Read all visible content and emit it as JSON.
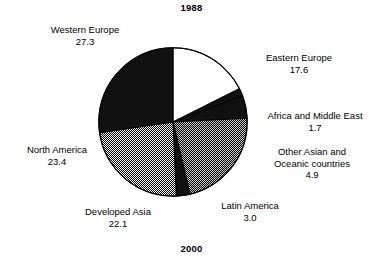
{
  "titles": {
    "top": "1988",
    "bottom": "2000"
  },
  "chart_data": {
    "type": "pie",
    "title": "1988",
    "subtitle": "2000",
    "xlabel": "",
    "ylabel": "",
    "units": "percent share",
    "total": 100.0,
    "legend_position": "callout-labels",
    "grid": false,
    "start_angle_deg": 0,
    "direction": "clockwise",
    "categories": [
      "Eastern Europe",
      "Africa and Middle East",
      "Other Asian and Oceanic countries",
      "Developed Asia",
      "Latin America",
      "North America",
      "Western Europe"
    ],
    "values": [
      17.6,
      1.7,
      4.9,
      22.1,
      3.0,
      23.4,
      27.3
    ],
    "slices": [
      {
        "label": "Eastern Europe",
        "label_line1": "Eastern Europe",
        "value": "17.6",
        "value_num": 17.6,
        "fill": "white",
        "fill_color": "#ffffff"
      },
      {
        "label": "Africa and Middle East",
        "label_line1": "Africa and Middle East",
        "value": "1.7",
        "value_num": 1.7,
        "fill": "black",
        "fill_color": "#111111"
      },
      {
        "label": "Other Asian and Oceanic countries",
        "label_line1": "Other Asian and",
        "label_line2": "Oceanic countries",
        "value": "4.9",
        "value_num": 4.9,
        "fill": "black",
        "fill_color": "#111111"
      },
      {
        "label": "Developed Asia",
        "label_line1": "Developed Asia",
        "value": "22.1",
        "value_num": 22.1,
        "fill": "dark-checker",
        "fill_color": "#6e6e6e"
      },
      {
        "label": "Latin America",
        "label_line1": "Latin America",
        "value": "3.0",
        "value_num": 3.0,
        "fill": "black",
        "fill_color": "#111111"
      },
      {
        "label": "North America",
        "label_line1": "North America",
        "value": "23.4",
        "value_num": 23.4,
        "fill": "light-checker",
        "fill_color": "#b9b9b9"
      },
      {
        "label": "Western Europe",
        "label_line1": "Western Europe",
        "value": "27.3",
        "value_num": 27.3,
        "fill": "black",
        "fill_color": "#111111"
      }
    ]
  }
}
